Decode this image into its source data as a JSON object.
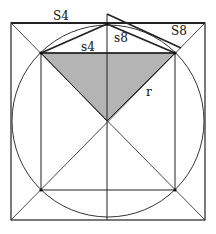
{
  "diagram": {
    "title": "",
    "colors": {
      "stroke": "#222222",
      "fill_triangle": "#b4b4b4",
      "background": "#ffffff"
    },
    "labels": {
      "outer_square_side": "S4",
      "inner_square_side": "s4",
      "inner_octagon_side": "s8",
      "outer_octagon_side": "S8",
      "radius": "r"
    }
  }
}
